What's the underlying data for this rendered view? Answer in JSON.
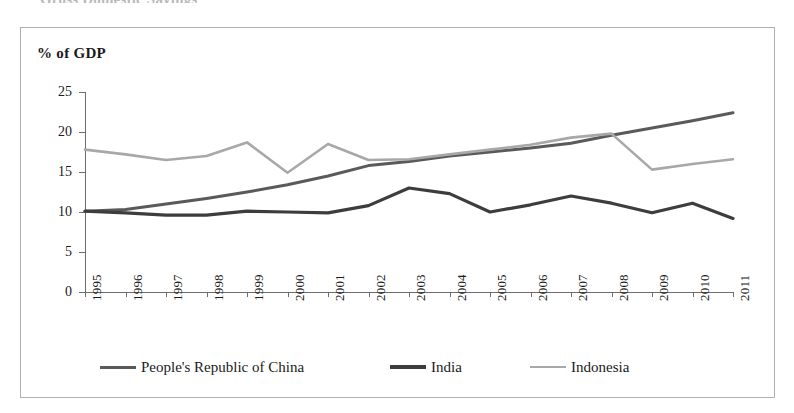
{
  "page": {
    "top_cut_text": "Gross Domestic Savings",
    "frame_border_color": "#b0b0b0"
  },
  "chart_data": {
    "type": "line",
    "title": "",
    "ylabel": "% of GDP",
    "xlabel": "",
    "ylim": [
      0,
      25
    ],
    "y_ticks": [
      "0",
      "5",
      "10",
      "15",
      "20",
      "25"
    ],
    "grid": false,
    "legend_position": "bottom",
    "categories": [
      "1995",
      "1996",
      "1997",
      "1998",
      "1999",
      "2000",
      "2001",
      "2002",
      "2003",
      "2004",
      "2005",
      "2006",
      "2007",
      "2008",
      "2009",
      "2010",
      "2011"
    ],
    "series": [
      {
        "name": "People's Republic of China",
        "color": "#5a5a5a",
        "values": [
          10.1,
          10.3,
          11.0,
          11.7,
          12.5,
          13.4,
          14.5,
          15.8,
          16.3,
          17.0,
          17.5,
          18.0,
          18.6,
          19.6,
          20.5,
          21.4,
          22.4
        ]
      },
      {
        "name": "India",
        "color": "#3d3d3d",
        "values": [
          10.1,
          9.9,
          9.6,
          9.6,
          10.1,
          10.0,
          9.9,
          10.8,
          13.0,
          12.3,
          10.0,
          10.9,
          12.0,
          11.1,
          9.9,
          11.1,
          9.2
        ]
      },
      {
        "name": "Indonesia",
        "color": "#a8a8a8",
        "values": [
          17.8,
          17.2,
          16.5,
          17.0,
          18.7,
          14.9,
          18.5,
          16.5,
          16.6,
          17.2,
          17.8,
          18.4,
          19.3,
          19.8,
          15.3,
          16.0,
          16.6
        ]
      }
    ]
  },
  "legend": {
    "items": [
      {
        "label": "People's Republic of China"
      },
      {
        "label": "India"
      },
      {
        "label": "Indonesia"
      }
    ]
  }
}
